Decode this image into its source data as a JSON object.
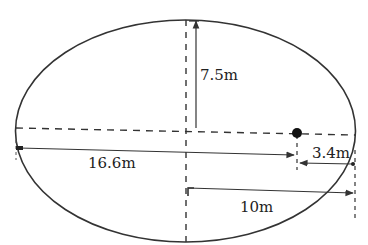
{
  "diagram": {
    "shape": "ellipse",
    "colors": {
      "stroke": "#333333",
      "background": "#ffffff"
    },
    "labels": {
      "semi_minor": "7.5m",
      "focus_from_left": "16.6m",
      "focus_to_right": "3.4m",
      "semi_major": "10m"
    },
    "point": "focus-dot"
  }
}
